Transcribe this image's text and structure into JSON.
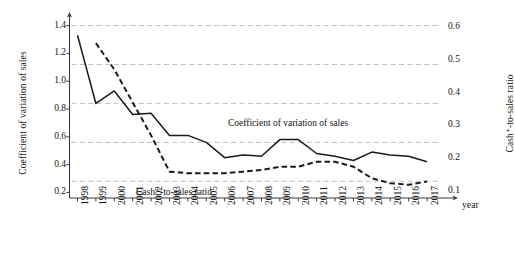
{
  "chart_data": {
    "type": "line",
    "title": "",
    "xlabel": "year",
    "ylabel": "Coefficient of variation of sales",
    "y2label": "Cash⁺-to-sales ratio",
    "grid": true,
    "legend_position": "inline-annotations",
    "x": [
      1998,
      1999,
      2000,
      2001,
      2002,
      2003,
      2004,
      2005,
      2006,
      2007,
      2008,
      2009,
      2010,
      2011,
      2012,
      2013,
      2014,
      2015,
      2016,
      2017
    ],
    "categories": [
      "1998",
      "1999",
      "2000",
      "2001",
      "2002",
      "2003",
      "2004",
      "2005",
      "2006",
      "2007",
      "2008",
      "2009",
      "2010",
      "2011",
      "2012",
      "2013",
      "2014",
      "2015",
      "2016",
      "2017"
    ],
    "ylim": [
      0.16,
      1.44
    ],
    "y2lim": [
      0.08,
      0.62
    ],
    "yticks": [
      "1.4",
      "1.2",
      "1.0",
      "0.8",
      "0.6",
      "0.4",
      "0.2"
    ],
    "ytick_values": [
      1.4,
      1.2,
      1.0,
      0.8,
      0.6,
      0.4,
      0.2
    ],
    "y2ticks": [
      "0.6",
      "0.5",
      "0.4",
      "0.3",
      "0.2",
      "0.1"
    ],
    "y2tick_values": [
      0.6,
      0.5,
      0.4,
      0.3,
      0.2,
      0.1
    ],
    "gridline_values_left": [
      1.4,
      1.12,
      0.84,
      0.56,
      0.28
    ],
    "series": [
      {
        "name": "Coefficient of variation of sales",
        "axis": "left",
        "style": "solid",
        "color": "#1a1a1a",
        "values": [
          1.33,
          0.84,
          0.93,
          0.76,
          0.77,
          0.61,
          0.61,
          0.56,
          0.45,
          0.47,
          0.46,
          0.58,
          0.58,
          0.48,
          0.46,
          0.43,
          0.49,
          0.47,
          0.46,
          0.42
        ]
      },
      {
        "name": "Cash⁺-to-sales ratio",
        "axis": "right",
        "style": "dashed",
        "color": "#1a1a1a",
        "values": [
          null,
          0.55,
          0.47,
          0.37,
          0.27,
          0.16,
          0.155,
          0.155,
          0.155,
          0.16,
          0.165,
          0.175,
          0.175,
          0.19,
          0.19,
          0.175,
          0.14,
          0.125,
          0.12,
          0.13
        ]
      }
    ],
    "annotations": [
      {
        "text": "Coefficient of variation of sales",
        "x": 2008,
        "y": 0.7
      },
      {
        "text": "Cash⁺-to-sales ratio",
        "x": 2002.5,
        "y": 0.23
      }
    ]
  },
  "axes": {
    "left_title": "Coefficient of variation of sales",
    "right_title": "Cash⁺-to-sales ratio",
    "x_title": "year"
  },
  "annotations": {
    "coefficient_label": "Coefficient of variation of sales",
    "cash_label": "Cash⁺-to-sales ratio"
  },
  "colors": {
    "line": "#1a1a1a",
    "grid": "#b9b9b9",
    "axis": "#3c3c3c",
    "background": "#ffffff"
  }
}
